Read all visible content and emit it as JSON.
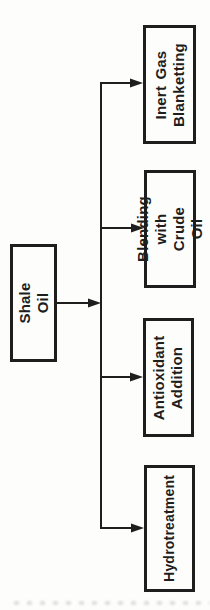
{
  "diagram": {
    "type": "flowchart",
    "text_orientation": "rotated 90 degrees counter-clockwise (reads bottom to top)",
    "source": {
      "label": "Shale Oil"
    },
    "targets": [
      {
        "label": "Inert Gas\nBlanketting"
      },
      {
        "label": "Blending with\nCrude Oil"
      },
      {
        "label": "Antioxidant\nAddition"
      },
      {
        "label": "Hydrotreatment"
      }
    ],
    "edges": [
      {
        "from": "Shale Oil",
        "to": "Inert Gas Blanketting",
        "arrow": "into target"
      },
      {
        "from": "Shale Oil",
        "to": "Blending with Crude Oil",
        "arrow": "into target"
      },
      {
        "from": "Shale Oil",
        "to": "Antioxidant Addition",
        "arrow": "into target"
      },
      {
        "from": "Shale Oil",
        "to": "Hydrotreatment",
        "arrow": "into target"
      },
      {
        "from": "Shale Oil",
        "to": "trunk junction",
        "arrow": "into trunk"
      }
    ],
    "colors": {
      "ink": "#1e1e1e",
      "background": "#fdfdfb"
    }
  }
}
